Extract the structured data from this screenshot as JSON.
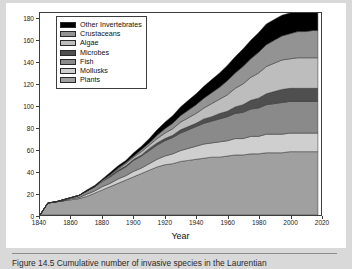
{
  "figure": {
    "caption": "Figure 14.5   Cumulative number of invasive species in the Laurentian"
  },
  "chart_data": {
    "type": "area",
    "stacked": true,
    "title": "",
    "xlabel": "Year",
    "ylabel": "Cumulative number of invasive species",
    "xlim": [
      1840,
      2020
    ],
    "ylim": [
      0,
      185
    ],
    "xticks": [
      1840,
      1860,
      1880,
      1900,
      1920,
      1940,
      1960,
      1980,
      2000,
      2020
    ],
    "yticks": [
      0,
      20,
      40,
      60,
      80,
      100,
      120,
      140,
      160,
      180
    ],
    "grid": false,
    "legend_position": "upper-left",
    "x": [
      1840,
      1845,
      1850,
      1855,
      1860,
      1865,
      1870,
      1875,
      1880,
      1885,
      1890,
      1895,
      1900,
      1905,
      1910,
      1915,
      1920,
      1925,
      1930,
      1935,
      1940,
      1945,
      1950,
      1955,
      1960,
      1965,
      1970,
      1975,
      1980,
      1985,
      1990,
      1995,
      2000,
      2005,
      2010,
      2015,
      2018
    ],
    "series": [
      {
        "name": "Plants",
        "color": "#a0a0a0",
        "values": [
          0,
          11,
          12,
          13,
          14,
          15,
          17,
          20,
          23,
          26,
          29,
          32,
          35,
          38,
          41,
          44,
          46,
          47,
          49,
          50,
          51,
          52,
          53,
          53,
          54,
          55,
          55,
          56,
          56,
          57,
          57,
          57,
          58,
          58,
          58,
          58,
          58
        ]
      },
      {
        "name": "Mollusks",
        "color": "#cfcfcf",
        "values": [
          0,
          0,
          0,
          0,
          1,
          1,
          2,
          2,
          3,
          3,
          4,
          4,
          5,
          5,
          6,
          7,
          8,
          9,
          10,
          11,
          12,
          13,
          13,
          14,
          14,
          15,
          15,
          16,
          16,
          17,
          17,
          17,
          17,
          17,
          17,
          17,
          17
        ]
      },
      {
        "name": "Fish",
        "color": "#8a8a8a",
        "values": [
          0,
          0,
          0,
          1,
          1,
          2,
          3,
          4,
          5,
          6,
          7,
          8,
          10,
          11,
          12,
          13,
          14,
          15,
          16,
          17,
          18,
          19,
          20,
          21,
          22,
          23,
          24,
          25,
          26,
          27,
          28,
          29,
          29,
          29,
          29,
          29,
          29
        ]
      },
      {
        "name": "Microbes",
        "color": "#4f4f4f",
        "values": [
          0,
          0,
          0,
          0,
          0,
          0,
          0,
          0,
          0,
          1,
          1,
          1,
          1,
          1,
          2,
          2,
          2,
          2,
          3,
          3,
          3,
          4,
          4,
          5,
          5,
          6,
          7,
          8,
          9,
          10,
          11,
          12,
          12,
          12,
          12,
          12,
          12
        ]
      },
      {
        "name": "Algae",
        "color": "#bdbdbd",
        "values": [
          0,
          0,
          0,
          0,
          0,
          0,
          0,
          0,
          1,
          1,
          1,
          2,
          2,
          3,
          3,
          4,
          5,
          6,
          7,
          8,
          9,
          10,
          12,
          13,
          15,
          17,
          19,
          21,
          23,
          25,
          26,
          27,
          27,
          28,
          28,
          28,
          28
        ]
      },
      {
        "name": "Crustaceans",
        "color": "#939393",
        "values": [
          0,
          0,
          0,
          0,
          0,
          0,
          0,
          0,
          0,
          0,
          1,
          1,
          1,
          2,
          2,
          3,
          4,
          5,
          6,
          7,
          8,
          9,
          10,
          11,
          13,
          14,
          16,
          17,
          19,
          20,
          21,
          22,
          23,
          24,
          24,
          25,
          25
        ]
      },
      {
        "name": "Other Invertebrates",
        "color": "#000000",
        "values": [
          0,
          0,
          0,
          0,
          0,
          0,
          1,
          1,
          1,
          2,
          2,
          2,
          3,
          3,
          4,
          5,
          6,
          7,
          8,
          9,
          10,
          11,
          12,
          13,
          14,
          15,
          16,
          17,
          18,
          19,
          19,
          19,
          19,
          19,
          19,
          19,
          19
        ]
      }
    ],
    "legend": [
      {
        "label": "Other Invertebrates",
        "color": "#000000"
      },
      {
        "label": "Crustaceans",
        "color": "#939393"
      },
      {
        "label": "Algae",
        "color": "#bdbdbd"
      },
      {
        "label": "Microbes",
        "color": "#4f4f4f"
      },
      {
        "label": "Fish",
        "color": "#8a8a8a"
      },
      {
        "label": "Mollusks",
        "color": "#cfcfcf"
      },
      {
        "label": "Plants",
        "color": "#a0a0a0"
      }
    ]
  }
}
